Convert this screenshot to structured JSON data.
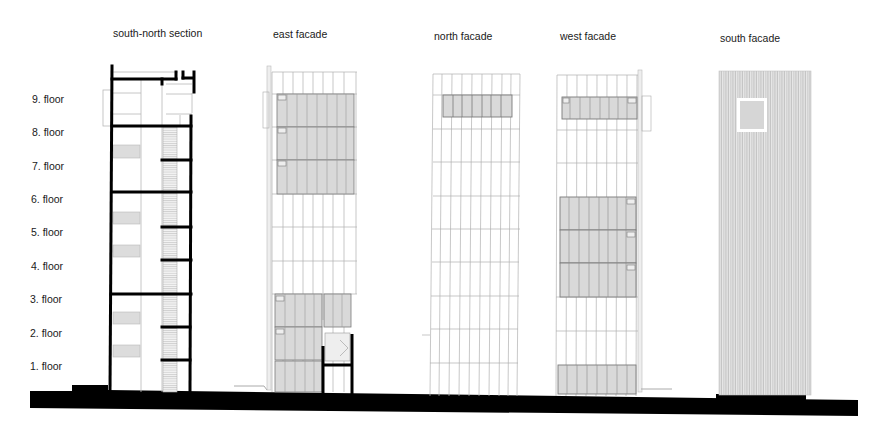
{
  "titles": {
    "section": "south-north section",
    "east": "east facade",
    "north": "north facade",
    "west": "west facade",
    "south": "south facade"
  },
  "floors": [
    {
      "label": "9. floor",
      "y": 100
    },
    {
      "label": "8. floor",
      "y": 133
    },
    {
      "label": "7. floor",
      "y": 166
    },
    {
      "label": "6. floor",
      "y": 199
    },
    {
      "label": "5. floor",
      "y": 233
    },
    {
      "label": "4. floor",
      "y": 266
    },
    {
      "label": "3. floor",
      "y": 300
    },
    {
      "label": "2. floor",
      "y": 333
    },
    {
      "label": "1. floor",
      "y": 366
    }
  ],
  "colors": {
    "ink": "#000000",
    "line": "#9a9a9a",
    "glass": "#d9d9d9",
    "glass_edge": "#777777",
    "cladding": "#cfcfcf"
  }
}
